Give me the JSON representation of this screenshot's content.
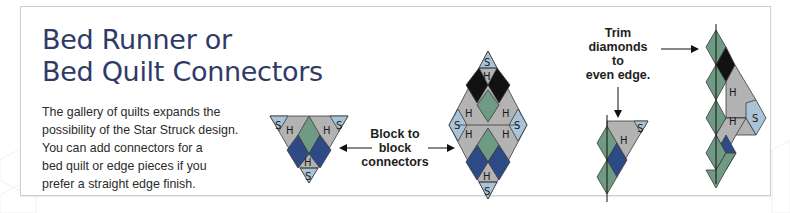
{
  "title": {
    "line1": "Bed Runner or",
    "line2": "Bed Quilt Connectors"
  },
  "description": {
    "lines": [
      "The gallery of quilts expands the",
      "possibility of the Star Struck design.",
      "You can add connectors for a",
      "bed quilt or edge pieces if you",
      "prefer a straight edge finish."
    ]
  },
  "labels": {
    "block_to_block": [
      "Block to",
      "block",
      "connectors"
    ],
    "trim": [
      "Trim",
      "diamonds",
      "to",
      "even edge."
    ]
  },
  "cell_letters": {
    "setting": "S",
    "half": "H"
  },
  "colors": {
    "title": "#2f3a66",
    "gray": "#b3b3b3",
    "light_blue": "#a8c4d6",
    "green": "#6f9a83",
    "navy": "#2e4a86",
    "black": "#111111",
    "outline": "#3a3a3a"
  },
  "diagrams": [
    {
      "name": "triangle-connector",
      "description": "Inverted triangle connector block"
    },
    {
      "name": "diamond-connector",
      "description": "Full diamond block-to-block connector"
    },
    {
      "name": "small-edge-piece",
      "description": "Trimmed small edge piece"
    },
    {
      "name": "tall-edge-piece",
      "description": "Trimmed tall edge piece"
    }
  ]
}
